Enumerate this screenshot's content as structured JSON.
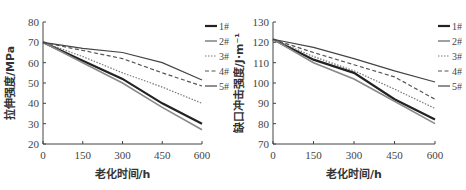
{
  "chart_data": [
    {
      "type": "line",
      "title": "",
      "xlabel": "老化时间/h",
      "ylabel": "拉伸强度/MPa",
      "x": [
        0,
        150,
        300,
        450,
        600
      ],
      "xticks": [
        "0",
        "150",
        "300",
        "450",
        "600"
      ],
      "yticks": [
        "20",
        "30",
        "40",
        "50",
        "60",
        "70",
        "80"
      ],
      "xlim": [
        0,
        600
      ],
      "ylim": [
        20,
        80
      ],
      "grid": false,
      "legend_position": "right",
      "series": [
        {
          "name": "1#",
          "style": "solid-thick",
          "values": [
            70,
            61,
            52,
            40,
            30
          ]
        },
        {
          "name": "2#",
          "style": "solid-gray",
          "values": [
            70,
            60,
            50,
            38,
            27
          ]
        },
        {
          "name": "3#",
          "style": "dotted",
          "values": [
            70,
            63,
            55,
            48,
            40
          ]
        },
        {
          "name": "4#",
          "style": "dashed",
          "values": [
            70,
            66,
            62,
            55,
            48.5
          ]
        },
        {
          "name": "5#",
          "style": "solid",
          "values": [
            70,
            67,
            65,
            60,
            51.5
          ]
        }
      ]
    },
    {
      "type": "line",
      "title": "",
      "xlabel": "老化时间/h",
      "ylabel": "缺口冲击强度/J·m⁻¹",
      "x": [
        0,
        150,
        300,
        450,
        600
      ],
      "xticks": [
        "0",
        "150",
        "300",
        "450",
        "600"
      ],
      "yticks": [
        "70",
        "80",
        "90",
        "100",
        "110",
        "120",
        "130"
      ],
      "xlim": [
        0,
        600
      ],
      "ylim": [
        70,
        130
      ],
      "grid": false,
      "legend_position": "right",
      "series": [
        {
          "name": "1#",
          "style": "solid-thick",
          "values": [
            121.5,
            111.5,
            105,
            92,
            82
          ]
        },
        {
          "name": "2#",
          "style": "solid-gray",
          "values": [
            121.5,
            110,
            102,
            91,
            80
          ]
        },
        {
          "name": "3#",
          "style": "dotted",
          "values": [
            121.5,
            113,
            106,
            97,
            87.5
          ]
        },
        {
          "name": "4#",
          "style": "dashed",
          "values": [
            121.5,
            115,
            109,
            103,
            92
          ]
        },
        {
          "name": "5#",
          "style": "solid",
          "values": [
            121.5,
            117.5,
            112,
            106,
            100.5
          ]
        }
      ]
    }
  ]
}
